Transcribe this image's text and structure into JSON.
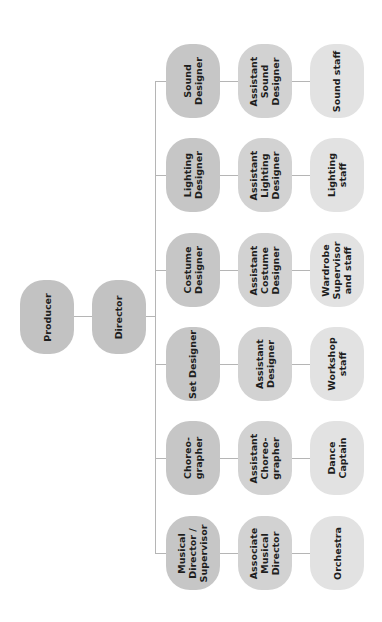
{
  "diagram": {
    "type": "org-chart",
    "orientation": "rotated-90-ccw",
    "top": [
      {
        "id": "producer",
        "label": "Producer"
      },
      {
        "id": "director",
        "label": "Director"
      }
    ],
    "departments": [
      {
        "id": "sound",
        "lead": "Sound\nDesigner",
        "assistant": "Assistant\nSound\nDesigner",
        "staff": "Sound staff"
      },
      {
        "id": "lighting",
        "lead": "Lighting\nDesigner",
        "assistant": "Assistant\nLighting\nDesigner",
        "staff": "Lighting\nstaff"
      },
      {
        "id": "costume",
        "lead": "Costume\nDesigner",
        "assistant": "Assistant\nCostume\nDesigner",
        "staff": "Wardrobe\nSupervisor\nand staff"
      },
      {
        "id": "set",
        "lead": "Set Designer",
        "assistant": "Assistant\nDesigner",
        "staff": "Workshop\nstaff"
      },
      {
        "id": "choreography",
        "lead": "Choreo-\ngrapher",
        "assistant": "Assistant\nChoreo-\ngrapher",
        "staff": "Dance\nCaptain"
      },
      {
        "id": "music",
        "lead": "Musical\nDirector /\nSupervisor",
        "assistant": "Associate\nMusical\nDirector",
        "staff": "Orchestra"
      }
    ],
    "colors": {
      "top": "#c2c2c2",
      "lead": "#c6c6c6",
      "assistant": "#d2d2d2",
      "staff": "#e2e2e2",
      "connector": "#b5b5b5",
      "text": "#1e1e1e"
    }
  }
}
